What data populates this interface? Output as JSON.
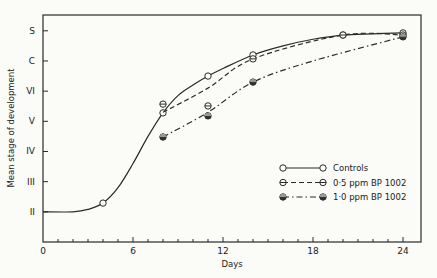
{
  "chart_data": {
    "type": "line",
    "title": "",
    "xlabel": "Days",
    "ylabel": "Mean stage of development",
    "xlim": [
      0,
      25
    ],
    "ylim": [
      1,
      8.35
    ],
    "x_ticks": [
      0,
      6,
      12,
      18,
      24
    ],
    "x_minor_step": 1,
    "y_ticks": [
      {
        "value": 2,
        "label": "II"
      },
      {
        "value": 3,
        "label": "III"
      },
      {
        "value": 4,
        "label": "IV"
      },
      {
        "value": 5,
        "label": "V"
      },
      {
        "value": 6,
        "label": "VI"
      },
      {
        "value": 7,
        "label": "C"
      },
      {
        "value": 8,
        "label": "S"
      }
    ],
    "grid": false,
    "legend_position": "bottom-right",
    "series": [
      {
        "name": "Controls",
        "marker": "open-circle",
        "line_style": "solid",
        "curve": [
          [
            0,
            2.0
          ],
          [
            2,
            2.0
          ],
          [
            3,
            2.08
          ],
          [
            4,
            2.29
          ],
          [
            5,
            2.8
          ],
          [
            6,
            3.6
          ],
          [
            7,
            4.5
          ],
          [
            8,
            5.28
          ],
          [
            9,
            5.85
          ],
          [
            10,
            6.2
          ],
          [
            11,
            6.5
          ],
          [
            12,
            6.75
          ],
          [
            14,
            7.2
          ],
          [
            16,
            7.5
          ],
          [
            18,
            7.72
          ],
          [
            20,
            7.86
          ],
          [
            22,
            7.9
          ],
          [
            24,
            7.93
          ]
        ],
        "points": [
          [
            4,
            2.29
          ],
          [
            8,
            5.28
          ],
          [
            11,
            6.5
          ],
          [
            14,
            7.2
          ],
          [
            20,
            7.86
          ],
          [
            24,
            7.93
          ]
        ]
      },
      {
        "name": "0·5 ppm BP 1002",
        "marker": "half-circle",
        "line_style": "dashed",
        "curve": [
          [
            8,
            5.3
          ],
          [
            11,
            6.1
          ],
          [
            14,
            7.07
          ],
          [
            20,
            7.86
          ],
          [
            24,
            7.86
          ]
        ],
        "points": [
          [
            8,
            5.57
          ],
          [
            11,
            5.51
          ],
          [
            14,
            7.07
          ],
          [
            20,
            7.86
          ],
          [
            24,
            7.86
          ]
        ]
      },
      {
        "name": "1·0 ppm BP 1002",
        "marker": "filled-circle",
        "line_style": "dash-dot",
        "curve": [
          [
            8,
            4.48
          ],
          [
            11,
            5.3
          ],
          [
            14,
            6.3
          ],
          [
            18,
            7.0
          ],
          [
            24,
            7.8
          ]
        ],
        "points": [
          [
            8,
            4.48
          ],
          [
            11,
            5.18
          ],
          [
            14,
            6.3
          ],
          [
            24,
            7.8
          ]
        ]
      }
    ]
  }
}
